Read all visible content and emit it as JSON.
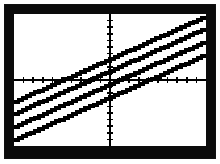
{
  "device": {
    "name": "graphing-calculator-screen",
    "bezel_color": "#0b0b0b",
    "screen_color": "#ffffff",
    "pixel_color": "#000000"
  },
  "chart_data": {
    "type": "line",
    "title": "",
    "subtitle": "",
    "xlabel": "",
    "ylabel": "",
    "grid": false,
    "legend": "none",
    "axes_shown": true,
    "tick_marks": true,
    "xlim": [
      -10,
      10
    ],
    "ylim": [
      -10,
      10
    ],
    "x_tick_step": 1,
    "y_tick_step": 1,
    "x_ticks": [
      -9,
      -8,
      -7,
      -6,
      -5,
      -4,
      -3,
      -2,
      -1,
      1,
      2,
      3,
      4,
      5,
      6,
      7,
      8,
      9
    ],
    "y_ticks": [
      -9,
      -8,
      -7,
      -6,
      -5,
      -4,
      -3,
      -2,
      -1,
      1,
      2,
      3,
      4,
      5,
      6,
      7,
      8,
      9
    ],
    "x": [
      -10,
      10
    ],
    "series": [
      {
        "name": "Y1",
        "slope": 0.65,
        "intercept": 3.2,
        "values": [
          -3.3,
          9.7
        ]
      },
      {
        "name": "Y2",
        "slope": 0.65,
        "intercept": 1.4,
        "values": [
          -5.1,
          7.9
        ]
      },
      {
        "name": "Y3",
        "slope": 0.65,
        "intercept": -0.6,
        "values": [
          -7.1,
          5.9
        ]
      },
      {
        "name": "Y4",
        "slope": 0.65,
        "intercept": -2.6,
        "values": [
          -9.1,
          3.9
        ]
      }
    ]
  }
}
